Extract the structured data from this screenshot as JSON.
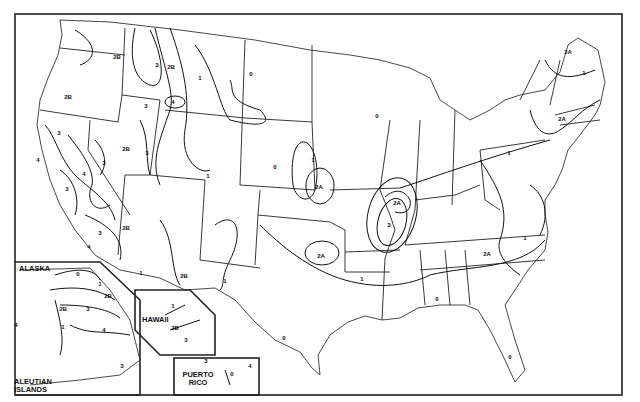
{
  "map": {
    "title": "Seismic Zone Map of the United States",
    "zones_legend": [
      "0",
      "1",
      "2A",
      "2B",
      "3",
      "4"
    ],
    "insets": {
      "alaska": "ALASKA",
      "aleutian": "ALEUTIAN ISLANDS",
      "hawaii": "HAWAII",
      "puerto_rico": "PUERTO RICO"
    },
    "labels": [
      {
        "id": "wa-2b",
        "text": "2B",
        "x": 117,
        "y": 57
      },
      {
        "id": "or-2b",
        "text": "2B",
        "x": 68,
        "y": 97
      },
      {
        "id": "id-3a",
        "text": "3",
        "x": 157,
        "y": 65
      },
      {
        "id": "id-2b",
        "text": "2B",
        "x": 171,
        "y": 67
      },
      {
        "id": "mt-1",
        "text": "1",
        "x": 200,
        "y": 78
      },
      {
        "id": "mt-4",
        "text": "4",
        "x": 173,
        "y": 102
      },
      {
        "id": "id-3b",
        "text": "3",
        "x": 146,
        "y": 106
      },
      {
        "id": "wy-0",
        "text": "0",
        "x": 251,
        "y": 74
      },
      {
        "id": "ca-3a",
        "text": "3",
        "x": 59,
        "y": 133
      },
      {
        "id": "ca-4a",
        "text": "4",
        "x": 38,
        "y": 160
      },
      {
        "id": "nv-2b",
        "text": "2B",
        "x": 126,
        "y": 149
      },
      {
        "id": "nv-3",
        "text": "3",
        "x": 104,
        "y": 163
      },
      {
        "id": "ut-3",
        "text": "3",
        "x": 147,
        "y": 153
      },
      {
        "id": "nv-4",
        "text": "4",
        "x": 84,
        "y": 174
      },
      {
        "id": "ca-3b",
        "text": "3",
        "x": 67,
        "y": 189
      },
      {
        "id": "co-1",
        "text": "1",
        "x": 208,
        "y": 176
      },
      {
        "id": "az-2b",
        "text": "2B",
        "x": 126,
        "y": 228
      },
      {
        "id": "ca-3c",
        "text": "3",
        "x": 100,
        "y": 233
      },
      {
        "id": "ca-4b",
        "text": "4",
        "x": 89,
        "y": 247
      },
      {
        "id": "ne-0",
        "text": "0",
        "x": 275,
        "y": 167
      },
      {
        "id": "ia-1",
        "text": "1",
        "x": 313,
        "y": 160
      },
      {
        "id": "ks-2a",
        "text": "2A",
        "x": 319,
        "y": 187
      },
      {
        "id": "mn-0",
        "text": "0",
        "x": 377,
        "y": 116
      },
      {
        "id": "az-1",
        "text": "1",
        "x": 141,
        "y": 273
      },
      {
        "id": "nm-2b",
        "text": "2B",
        "x": 184,
        "y": 276
      },
      {
        "id": "nm-1",
        "text": "1",
        "x": 225,
        "y": 281
      },
      {
        "id": "ok-2a",
        "text": "2A",
        "x": 321,
        "y": 256
      },
      {
        "id": "ar-1",
        "text": "1",
        "x": 362,
        "y": 279
      },
      {
        "id": "il-2a",
        "text": "2A",
        "x": 397,
        "y": 203
      },
      {
        "id": "mo-3",
        "text": "3",
        "x": 389,
        "y": 225
      },
      {
        "id": "tx-0",
        "text": "0",
        "x": 284,
        "y": 338
      },
      {
        "id": "gulf-0",
        "text": "0",
        "x": 437,
        "y": 299
      },
      {
        "id": "fl-0",
        "text": "0",
        "x": 510,
        "y": 357
      },
      {
        "id": "sc-2a",
        "text": "2A",
        "x": 487,
        "y": 254
      },
      {
        "id": "nc-1",
        "text": "1",
        "x": 525,
        "y": 238
      },
      {
        "id": "pa-1",
        "text": "1",
        "x": 509,
        "y": 153
      },
      {
        "id": "ne-2a",
        "text": "2A",
        "x": 562,
        "y": 119
      },
      {
        "id": "me-1",
        "text": "1",
        "x": 584,
        "y": 73
      },
      {
        "id": "me-2a",
        "text": "2A",
        "x": 568,
        "y": 52
      },
      {
        "id": "ak-0",
        "text": "0",
        "x": 78,
        "y": 274
      },
      {
        "id": "ak-1a",
        "text": "1",
        "x": 100,
        "y": 284
      },
      {
        "id": "ak-2b",
        "text": "2B",
        "x": 108,
        "y": 296
      },
      {
        "id": "ak-2b2",
        "text": "2B",
        "x": 63,
        "y": 309
      },
      {
        "id": "ak-3",
        "text": "3",
        "x": 88,
        "y": 309
      },
      {
        "id": "ak-1b",
        "text": "1",
        "x": 63,
        "y": 327
      },
      {
        "id": "ak-4",
        "text": "4",
        "x": 104,
        "y": 330
      },
      {
        "id": "ak-4b",
        "text": "4",
        "x": 16,
        "y": 325
      },
      {
        "id": "aleut-3",
        "text": "3",
        "x": 122,
        "y": 366
      },
      {
        "id": "hi-1",
        "text": "1",
        "x": 173,
        "y": 306
      },
      {
        "id": "hi-2b",
        "text": "2B",
        "x": 175,
        "y": 328
      },
      {
        "id": "hi-3",
        "text": "3",
        "x": 186,
        "y": 340
      },
      {
        "id": "pr-3",
        "text": "3",
        "x": 206,
        "y": 361
      },
      {
        "id": "pr-4",
        "text": "4",
        "x": 250,
        "y": 366
      },
      {
        "id": "pr-0",
        "text": "0",
        "x": 232,
        "y": 374
      }
    ]
  }
}
